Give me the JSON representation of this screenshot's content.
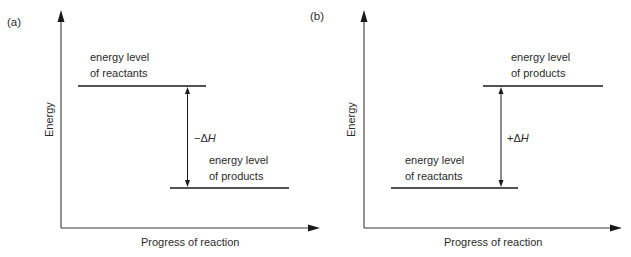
{
  "figure": {
    "panels": [
      {
        "id": "a",
        "label": "(a)",
        "y_axis_label": "Energy",
        "x_axis_label": "Progress of reaction",
        "upper_level": {
          "line1": "energy level",
          "line2": "of reactants"
        },
        "lower_level": {
          "line1": "energy level",
          "line2": "of products"
        },
        "delta_h": {
          "sign": "−Δ",
          "symbol": "H"
        },
        "reaction_type": "exothermic"
      },
      {
        "id": "b",
        "label": "(b)",
        "y_axis_label": "Energy",
        "x_axis_label": "Progress of reaction",
        "upper_level": {
          "line1": "energy level",
          "line2": "of products"
        },
        "lower_level": {
          "line1": "energy level",
          "line2": "of reactants"
        },
        "delta_h": {
          "sign": "+Δ",
          "symbol": "H"
        },
        "reaction_type": "endothermic"
      }
    ],
    "colors": {
      "line": "#1a1a1a",
      "axis": "#3a3a3a",
      "text": "#2b2b2b",
      "background": "#ffffff"
    }
  }
}
